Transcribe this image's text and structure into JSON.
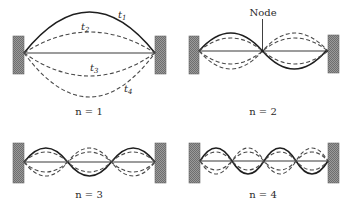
{
  "figure": {
    "colors": {
      "wall_fill": "#8a8a8a",
      "solid_curve": "#1e1e1e",
      "dashed_curve": "#4a4a4a",
      "background": "#ffffff"
    }
  },
  "panels": [
    {
      "id": "n1",
      "caption": "n = 1",
      "harmonic": 1,
      "time_labels": {
        "t1": {
          "base": "t",
          "sub": "1"
        },
        "t2": {
          "base": "t",
          "sub": "2"
        },
        "t3": {
          "base": "t",
          "sub": "3"
        },
        "t4": {
          "base": "t",
          "sub": "4"
        }
      }
    },
    {
      "id": "n2",
      "caption": "n = 2",
      "harmonic": 2,
      "node_label": "Node"
    },
    {
      "id": "n3",
      "caption": "n = 3",
      "harmonic": 3
    },
    {
      "id": "n4",
      "caption": "n = 4",
      "harmonic": 4
    }
  ]
}
